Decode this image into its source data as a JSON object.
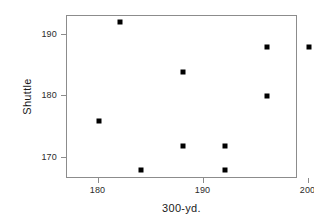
{
  "chart_data": {
    "type": "scatter",
    "title": "",
    "xlabel": "300-yd.",
    "ylabel": "Shuttle",
    "x": [
      180,
      182,
      184,
      188,
      188,
      192,
      192,
      196,
      196,
      200
    ],
    "y": [
      176,
      192,
      168,
      184,
      172,
      172,
      168,
      188,
      180,
      188
    ],
    "points": [
      {
        "x": 180,
        "y": 176
      },
      {
        "x": 182,
        "y": 192
      },
      {
        "x": 184,
        "y": 168
      },
      {
        "x": 188,
        "y": 184
      },
      {
        "x": 188,
        "y": 172
      },
      {
        "x": 192,
        "y": 172
      },
      {
        "x": 192,
        "y": 168
      },
      {
        "x": 196,
        "y": 188
      },
      {
        "x": 196,
        "y": 180
      },
      {
        "x": 200,
        "y": 188
      }
    ],
    "xticks": [
      180,
      190,
      200
    ],
    "xtick_labels": [
      "180",
      "190",
      "200"
    ],
    "yticks": [
      170,
      180,
      190
    ],
    "ytick_labels": [
      "170",
      "180",
      "190"
    ],
    "xlim": [
      177.0,
      199.0
    ],
    "ylim": [
      166.6,
      193.0
    ],
    "grid": false,
    "legend": null,
    "marker": "filled-square",
    "marker_color": "#000000",
    "frame_color": "#8c8c8c",
    "background_color": "#ffffff"
  }
}
